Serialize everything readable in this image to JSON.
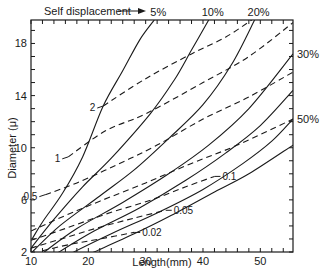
{
  "chart_data": {
    "type": "line",
    "title": "",
    "xlabel": "Length(mm)",
    "ylabel": "Diameter (μ)",
    "xlim": [
      10,
      55.7
    ],
    "ylim": [
      2,
      19.8
    ],
    "x_ticks": [
      10,
      20,
      30,
      40,
      50
    ],
    "y_ticks": [
      2,
      6,
      10,
      14,
      18
    ],
    "x_minor_step": 2,
    "y_minor_step": 1,
    "grid": false,
    "annotation_top": "Self displacement",
    "series_solid_label": "Self displacement (%)",
    "series": [
      {
        "name": "5%",
        "style": "solid",
        "label": "5%",
        "label_pos": "top",
        "points": [
          [
            10.2,
            3.0
          ],
          [
            12,
            4.3
          ],
          [
            15.5,
            6.5
          ],
          [
            19,
            9.3
          ],
          [
            22.6,
            13.2
          ],
          [
            26,
            15.9
          ],
          [
            29,
            18.3
          ],
          [
            31.5,
            19.8
          ]
        ]
      },
      {
        "name": "10%",
        "style": "solid",
        "label": "10%",
        "label_pos": "top",
        "points": [
          [
            10,
            2.3
          ],
          [
            14,
            4.5
          ],
          [
            19,
            7.0
          ],
          [
            24,
            9.2
          ],
          [
            30.8,
            12.6
          ],
          [
            35,
            15.2
          ],
          [
            38,
            17.5
          ],
          [
            41,
            19.8
          ]
        ]
      },
      {
        "name": "20%",
        "style": "solid",
        "label": "20%",
        "label_pos": "top",
        "points": [
          [
            10,
            1.9
          ],
          [
            15,
            4.0
          ],
          [
            22,
            6.3
          ],
          [
            28,
            8.3
          ],
          [
            34,
            10.7
          ],
          [
            40,
            13.3
          ],
          [
            45,
            16.4
          ],
          [
            49,
            19.8
          ]
        ]
      },
      {
        "name": "30%",
        "style": "solid",
        "label": "30%",
        "label_pos": "right",
        "points": [
          [
            12,
            1.9
          ],
          [
            18,
            3.8
          ],
          [
            26,
            5.8
          ],
          [
            34,
            8.0
          ],
          [
            41,
            10.2
          ],
          [
            48,
            13.0
          ],
          [
            55.7,
            17.2
          ]
        ]
      },
      {
        "name": "40%",
        "style": "solid",
        "label": "",
        "label_pos": "none",
        "points": [
          [
            14.5,
            1.9
          ],
          [
            21,
            3.6
          ],
          [
            29,
            5.4
          ],
          [
            37,
            7.5
          ],
          [
            44,
            9.6
          ],
          [
            50,
            11.7
          ],
          [
            55.7,
            14.4
          ]
        ]
      },
      {
        "name": "50%",
        "style": "solid",
        "label": "50%",
        "label_pos": "right",
        "points": [
          [
            17,
            1.9
          ],
          [
            24,
            3.4
          ],
          [
            32,
            5.0
          ],
          [
            40,
            6.8
          ],
          [
            47,
            8.8
          ],
          [
            52,
            10.5
          ],
          [
            55.7,
            12.2
          ]
        ]
      },
      {
        "name": "60%",
        "style": "solid",
        "label": "",
        "label_pos": "none",
        "points": [
          [
            20.5,
            1.9
          ],
          [
            28,
            3.4
          ],
          [
            34,
            4.7
          ],
          [
            42,
            6.6
          ],
          [
            48,
            8.0
          ],
          [
            55.7,
            10.2
          ]
        ]
      },
      {
        "name": "2",
        "style": "dashed",
        "label": "2",
        "label_at": [
          22.2,
          13.2
        ],
        "points": [
          [
            22.6,
            13.2
          ],
          [
            30,
            15.3
          ],
          [
            38,
            17.2
          ],
          [
            44,
            18.5
          ],
          [
            48.5,
            19.8
          ]
        ]
      },
      {
        "name": "1",
        "style": "dashed",
        "label": "1",
        "label_at": [
          15.8,
          9.3
        ],
        "points": [
          [
            16.5,
            9.3
          ],
          [
            23,
            11.3
          ],
          [
            30,
            12.6
          ],
          [
            40,
            15.0
          ],
          [
            48,
            17.0
          ],
          [
            55.7,
            19.6
          ]
        ]
      },
      {
        "name": "0.5",
        "style": "dashed",
        "label": "0.5",
        "label_at": [
          11,
          6.5
        ],
        "points": [
          [
            12.5,
            6.4
          ],
          [
            18,
            7.3
          ],
          [
            25,
            8.7
          ],
          [
            32,
            10.2
          ],
          [
            40,
            12.2
          ],
          [
            48,
            13.9
          ],
          [
            55.7,
            15.8
          ]
        ]
      },
      {
        "name": "0.2",
        "style": "dashed",
        "label": "",
        "label_at": null,
        "points": [
          [
            10,
            3.6
          ],
          [
            16,
            4.8
          ],
          [
            22,
            5.9
          ],
          [
            30,
            7.3
          ],
          [
            38,
            8.8
          ],
          [
            46,
            10.2
          ],
          [
            55.7,
            12.2
          ]
        ]
      },
      {
        "name": "0.1",
        "style": "dashed",
        "label": "0.1",
        "label_at": [
          43,
          7.8
        ],
        "points": [
          [
            10,
            2.9
          ],
          [
            16,
            3.8
          ],
          [
            23,
            4.9
          ],
          [
            31,
            6.0
          ],
          [
            37,
            7.0
          ],
          [
            42,
            7.8
          ]
        ]
      },
      {
        "name": "0.05",
        "style": "dashed",
        "label": "0.05",
        "label_at": [
          34.5,
          5.2
        ],
        "points": [
          [
            10,
            2.3
          ],
          [
            16,
            3.1
          ],
          [
            22,
            3.9
          ],
          [
            28,
            4.6
          ],
          [
            33.5,
            5.2
          ]
        ]
      },
      {
        "name": "0.02",
        "style": "dashed",
        "label": "0.02",
        "label_at": [
          29,
          3.5
        ],
        "points": [
          [
            12,
            2.1
          ],
          [
            17,
            2.6
          ],
          [
            22,
            3.0
          ],
          [
            28,
            3.5
          ]
        ]
      }
    ],
    "legend": "none"
  }
}
